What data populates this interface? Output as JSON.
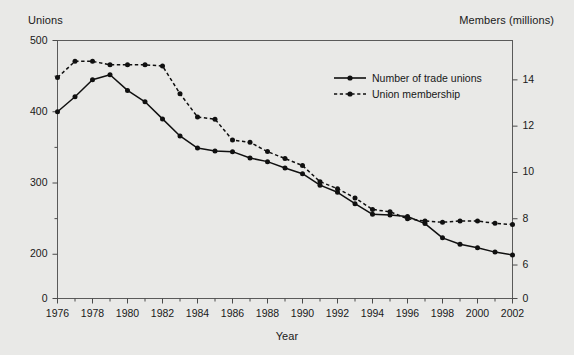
{
  "chart_data": {
    "type": "line",
    "title": "",
    "xlabel": "Year",
    "ylabel": "Unions",
    "y2label": "Members (millions)",
    "grid": false,
    "legend_position": "upper-right-inside",
    "background_color": "#e9e9e7",
    "line_color": "#101010",
    "x": [
      1976,
      1977,
      1978,
      1979,
      1980,
      1981,
      1982,
      1983,
      1984,
      1985,
      1986,
      1987,
      1988,
      1989,
      1990,
      1991,
      1992,
      1993,
      1994,
      1995,
      1996,
      1997,
      1998,
      1999,
      2000,
      2001,
      2002
    ],
    "xlim": [
      1976,
      2002
    ],
    "xticks": [
      1976,
      1978,
      1980,
      1982,
      1984,
      1986,
      1988,
      1990,
      1992,
      1994,
      1996,
      1998,
      2000,
      2002
    ],
    "xticklabels": [
      "1976",
      "1978",
      "1980",
      "1982",
      "1984",
      "1986",
      "1988",
      "1990",
      "1992",
      "1994",
      "1996",
      "1998",
      "2000",
      "2002"
    ],
    "yticks_left": [
      0,
      200,
      300,
      400,
      500
    ],
    "yticklabels_left": [
      "0",
      "200",
      "300",
      "400",
      "500"
    ],
    "ylim_left": [
      180,
      500
    ],
    "yticks_right": [
      0,
      6,
      8,
      10,
      12,
      14
    ],
    "yticklabels_right": [
      "0",
      "6",
      "8",
      "10",
      "12",
      "14"
    ],
    "ylim_right": [
      5.85,
      15.7
    ],
    "axis_note": "Both value axes are broken below the second tick (200 on the left, 6 on the right); the 0 tick sits at the axis base.",
    "series": [
      {
        "name": "Number of trade unions",
        "axis": "left",
        "style": "solid",
        "marker": "filled-circle",
        "values": [
          400,
          421,
          445,
          452,
          430,
          414,
          390,
          366,
          349,
          345,
          344,
          335,
          330,
          321,
          313,
          297,
          287,
          271,
          256,
          255,
          253,
          243,
          223,
          214,
          209,
          203,
          199
        ]
      },
      {
        "name": "Union membership",
        "axis": "right",
        "style": "dashed",
        "marker": "filled-circle",
        "values": [
          14.1,
          14.8,
          14.8,
          14.65,
          14.65,
          14.65,
          14.6,
          13.4,
          12.4,
          12.3,
          11.4,
          11.3,
          10.9,
          10.6,
          10.3,
          9.6,
          9.3,
          8.9,
          8.4,
          8.3,
          8.0,
          7.9,
          7.85,
          7.9,
          7.9,
          7.8,
          7.75
        ]
      }
    ]
  },
  "axis_titles": {
    "left": "Unions",
    "right": "Members (millions)",
    "bottom": "Year"
  },
  "legend": {
    "items": [
      {
        "label": "Number of trade unions",
        "style": "solid"
      },
      {
        "label": "Union membership",
        "style": "dashed"
      }
    ]
  }
}
